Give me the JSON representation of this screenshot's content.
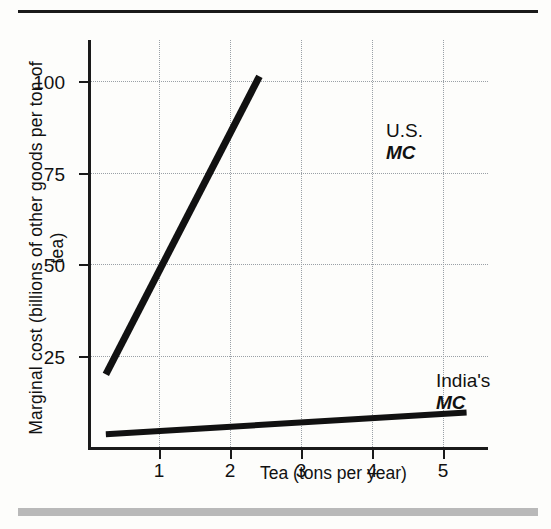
{
  "chart_data": {
    "type": "line",
    "title": "",
    "xlabel": "Tea (tons per year)",
    "ylabel": "Marginal cost (billions of other goods per ton of tea)",
    "xlim": [
      0,
      5.6
    ],
    "ylim": [
      0,
      112
    ],
    "xticks": [
      "1",
      "2",
      "3",
      "4",
      "5"
    ],
    "xtick_values": [
      1,
      2,
      3,
      4,
      5
    ],
    "yticks": [
      "25",
      "50",
      "75",
      "100"
    ],
    "ytick_values": [
      25,
      50,
      75,
      100
    ],
    "grid": "dotted",
    "legend_position": "inline-annotations",
    "series": [
      {
        "name": "U.S. MC",
        "label_line1": "U.S.",
        "label_line2": "MC",
        "color": "#111111",
        "x": [
          0.25,
          2.4
        ],
        "y": [
          20,
          102
        ]
      },
      {
        "name": "India's MC",
        "label_line1": "India's",
        "label_line2": "MC",
        "color": "#111111",
        "x": [
          0.25,
          5.3
        ],
        "y": [
          3.5,
          9.5
        ]
      }
    ]
  }
}
